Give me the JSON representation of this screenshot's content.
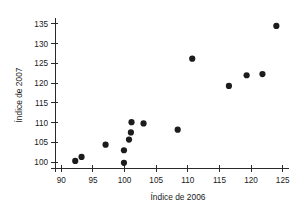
{
  "chart_data": {
    "type": "scatter",
    "title": "",
    "subtitle": "",
    "xlabel": "Índice de 2006",
    "ylabel": "Índice de 2007",
    "xlim": [
      89.0,
      126.0
    ],
    "ylim": [
      98.5,
      136.5
    ],
    "xticks": [
      90,
      95,
      100,
      105,
      110,
      115,
      120,
      125
    ],
    "xtick_labels": [
      "90",
      "95",
      "100",
      "105",
      "110",
      "115",
      "120",
      "125"
    ],
    "yticks": [
      100,
      105,
      110,
      115,
      120,
      125,
      130,
      135
    ],
    "ytick_labels": [
      "100",
      "105",
      "110",
      "115",
      "120",
      "125",
      "130",
      "135"
    ],
    "grid": false,
    "legend": null,
    "marker": "circle",
    "marker_color": "#1c1c1c",
    "marker_size": 3.1,
    "annotations": [],
    "points": [
      {
        "x": 92.2,
        "y": 100.3
      },
      {
        "x": 93.2,
        "y": 101.3
      },
      {
        "x": 97.0,
        "y": 104.4
      },
      {
        "x": 99.9,
        "y": 99.8
      },
      {
        "x": 99.9,
        "y": 103.0
      },
      {
        "x": 100.7,
        "y": 105.7
      },
      {
        "x": 101.0,
        "y": 107.5
      },
      {
        "x": 101.1,
        "y": 110.1
      },
      {
        "x": 103.0,
        "y": 109.8
      },
      {
        "x": 108.4,
        "y": 108.2
      },
      {
        "x": 110.7,
        "y": 126.2
      },
      {
        "x": 116.5,
        "y": 119.3
      },
      {
        "x": 119.3,
        "y": 122.0
      },
      {
        "x": 121.8,
        "y": 122.3
      },
      {
        "x": 124.0,
        "y": 134.5
      }
    ]
  },
  "axes": {
    "x_title": "Índice de 2006",
    "y_title": "Índice de 2007"
  }
}
